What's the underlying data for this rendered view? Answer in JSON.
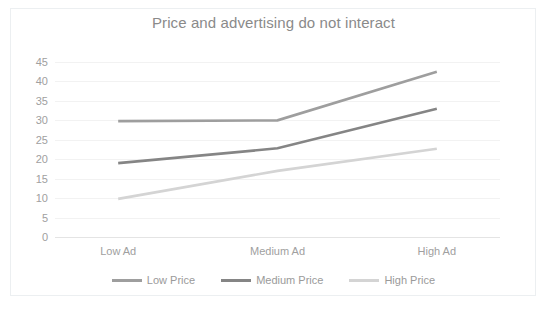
{
  "chart_data": {
    "type": "line",
    "title": "Price and advertising do not interact",
    "xlabel": "",
    "ylabel": "",
    "categories": [
      "Low Ad",
      "Medium Ad",
      "High Ad"
    ],
    "series": [
      {
        "name": "Low Price",
        "values": [
          29.8,
          30.0,
          42.5
        ],
        "color": "#9e9e9e"
      },
      {
        "name": "Medium Price",
        "values": [
          19.0,
          22.8,
          33.0
        ],
        "color": "#858585"
      },
      {
        "name": "High Price",
        "values": [
          9.8,
          17.0,
          22.7
        ],
        "color": "#d4d4d4"
      }
    ],
    "ylim": [
      0,
      45
    ],
    "ytick_values": [
      0,
      5,
      10,
      15,
      20,
      25,
      30,
      35,
      40,
      45
    ],
    "ytick_labels": [
      "0",
      "5",
      "10",
      "15",
      "20",
      "25",
      "30",
      "35",
      "40",
      "45"
    ],
    "grid": true,
    "grid_color": "#f2f2f2",
    "legend_position": "bottom",
    "title_color": "#8a8a8a",
    "tick_color": "#a0a0a0",
    "background": "#ffffff",
    "border_color": "#eceff1"
  }
}
